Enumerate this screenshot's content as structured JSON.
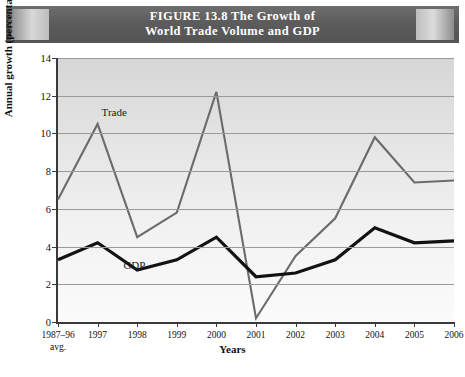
{
  "figure": {
    "title_line1": "FIGURE 13.8   The Growth of",
    "title_line2": "World Trade Volume and GDP"
  },
  "chart_data": {
    "type": "line",
    "title": "FIGURE 13.8 The Growth of World Trade Volume and GDP",
    "xlabel": "Years",
    "ylabel": "Annual growth (percentages)",
    "categories": [
      "1987–96",
      "1997",
      "1998",
      "1999",
      "2000",
      "2001",
      "2002",
      "2003",
      "2004",
      "2005",
      "2006"
    ],
    "category_sublabels": [
      "avg.",
      "",
      "",
      "",
      "",
      "",
      "",
      "",
      "",
      "",
      ""
    ],
    "ylim": [
      0,
      14
    ],
    "yticks": [
      0,
      2,
      4,
      6,
      8,
      10,
      12,
      14
    ],
    "grid": true,
    "legend": "inline-labels",
    "series": [
      {
        "name": "Trade",
        "color": "#6b6b6b",
        "values": [
          6.5,
          10.5,
          4.5,
          5.8,
          12.2,
          0.2,
          3.5,
          5.5,
          9.8,
          7.4,
          7.5
        ]
      },
      {
        "name": "GDP",
        "color": "#121212",
        "values": [
          3.3,
          4.2,
          2.75,
          3.3,
          4.5,
          2.4,
          2.6,
          3.3,
          5.0,
          4.2,
          4.3
        ]
      }
    ],
    "annotations": [
      {
        "text": "Trade",
        "x_index": 1,
        "y_value": 11.1
      },
      {
        "text": "GDP",
        "x_index": 1.55,
        "y_value": 2.95
      }
    ]
  }
}
